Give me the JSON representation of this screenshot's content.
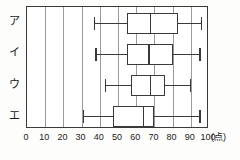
{
  "chart_data": {
    "type": "box",
    "title": "",
    "subtitle": "",
    "xlabel": "",
    "ylabel": "",
    "unit_label": "(点)",
    "xlim": [
      0,
      100
    ],
    "xticks": [
      0,
      10,
      20,
      30,
      40,
      50,
      60,
      70,
      80,
      90,
      100
    ],
    "xtick_labels": [
      "0",
      "10",
      "20",
      "30",
      "40",
      "50",
      "60",
      "70",
      "80",
      "90",
      "100"
    ],
    "grid": true,
    "grid_axis": "x",
    "legend": "none",
    "orientation": "horizontal",
    "categories": [
      "ア",
      "イ",
      "ウ",
      "エ"
    ],
    "boxes": [
      {
        "category": "ア",
        "min": 37,
        "q1": 55,
        "median": 68,
        "q3": 83,
        "max": 96
      },
      {
        "category": "イ",
        "min": 38,
        "q1": 55,
        "median": 67,
        "q3": 80,
        "max": 95
      },
      {
        "category": "ウ",
        "min": 43,
        "q1": 57,
        "median": 68,
        "q3": 76,
        "max": 90
      },
      {
        "category": "エ",
        "min": 31,
        "q1": 47,
        "median": 64,
        "q3": 70,
        "max": 95
      }
    ]
  },
  "axis": {
    "unit": "(点)"
  },
  "categories": {
    "a": "ア",
    "i": "イ",
    "u": "ウ",
    "e": "エ"
  },
  "ticks": {
    "t0": "0",
    "t10": "10",
    "t20": "20",
    "t30": "30",
    "t40": "40",
    "t50": "50",
    "t60": "60",
    "t70": "70",
    "t80": "80",
    "t90": "90",
    "t100": "100"
  },
  "colors": {
    "stroke": "#3a3a3a",
    "grid": "#9a9a9a",
    "background": "#ffffff",
    "text": "#1b1b1b"
  }
}
